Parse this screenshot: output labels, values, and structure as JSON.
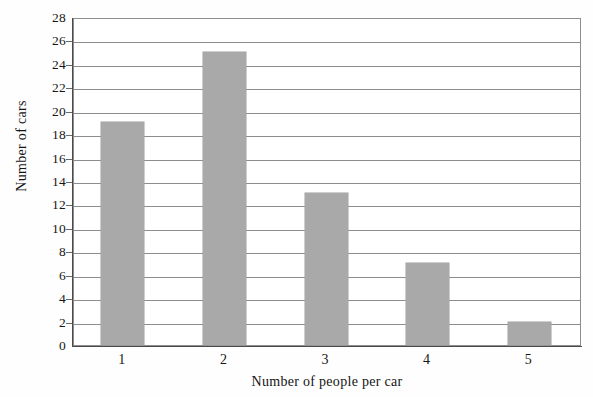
{
  "chart_data": {
    "type": "bar",
    "title": "",
    "subtitle": "",
    "categories": [
      "1",
      "2",
      "3",
      "4",
      "5"
    ],
    "values": [
      19,
      25,
      13,
      7,
      2
    ],
    "xlabel": "Number of people per car",
    "ylabel": "Number of cars",
    "ylim": [
      0,
      28
    ],
    "ytick_step": 2,
    "yticks": [
      0,
      2,
      4,
      6,
      8,
      10,
      12,
      14,
      16,
      18,
      20,
      22,
      24,
      26,
      28
    ],
    "ytick_labels": [
      "0",
      "2",
      "4",
      "6",
      "8",
      "10",
      "12",
      "14",
      "16",
      "18",
      "20",
      "22",
      "24",
      "26",
      "28"
    ],
    "grid": "horizontal",
    "legend": "none",
    "annotations": [],
    "colors": {
      "bar_fill": "#a9a9a9",
      "gridline": "#8d8d8d",
      "axis_line": "#4a4a4a",
      "plot_background": "#ffffff",
      "figure_background": "#fefefe",
      "text": "#171717"
    }
  }
}
